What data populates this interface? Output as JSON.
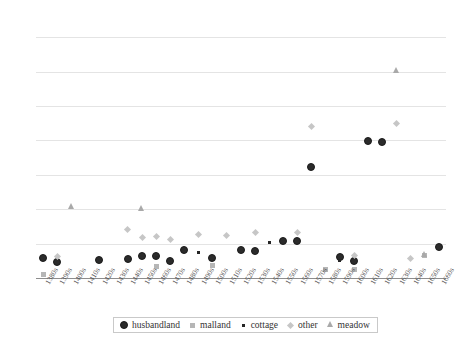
{
  "chart_data": {
    "type": "scatter",
    "title": "",
    "xlabel": "",
    "ylabel": "Rent (s.)",
    "ylim": [
      0,
      75
    ],
    "yticks": [
      0,
      10,
      20,
      30,
      40,
      50,
      60,
      70
    ],
    "grid": true,
    "legend_position": "bottom",
    "categories": [
      "1380s",
      "1390s",
      "1400s",
      "1410s",
      "1420s",
      "1430s",
      "1440s",
      "1450s",
      "1460s",
      "1470s",
      "1480s",
      "1490s",
      "1500s",
      "1510s",
      "1520s",
      "1530s",
      "1540s",
      "1550s",
      "1560s",
      "1570s",
      "1580s",
      "1590s",
      "1600s",
      "1610s",
      "1620s",
      "1630s",
      "1640s",
      "1650s",
      "1660s"
    ],
    "series": [
      {
        "name": "husbandland",
        "color": "#2b2b2b",
        "marker": "circle",
        "points": [
          {
            "x": "1380s",
            "y": 5.7
          },
          {
            "x": "1390s",
            "y": 4.6
          },
          {
            "x": "1420s",
            "y": 5.2
          },
          {
            "x": "1440s",
            "y": 5.3
          },
          {
            "x": "1450s",
            "y": 6.3
          },
          {
            "x": "1460s",
            "y": 6.3
          },
          {
            "x": "1470s",
            "y": 5.0
          },
          {
            "x": "1480s",
            "y": 8.0
          },
          {
            "x": "1500s",
            "y": 5.6
          },
          {
            "x": "1520s",
            "y": 8.1
          },
          {
            "x": "1530s",
            "y": 7.7
          },
          {
            "x": "1550s",
            "y": 10.7
          },
          {
            "x": "1560s",
            "y": 10.7
          },
          {
            "x": "1570s",
            "y": 32.3
          },
          {
            "x": "1590s",
            "y": 6.1
          },
          {
            "x": "1600s",
            "y": 5.0
          },
          {
            "x": "1610s",
            "y": 39.6
          },
          {
            "x": "1620s",
            "y": 39.5
          },
          {
            "x": "1660s",
            "y": 9.0
          }
        ]
      },
      {
        "name": "malland",
        "color": "#b6b6b6",
        "marker": "square",
        "points": [
          {
            "x": "1380s",
            "y": 1.1
          },
          {
            "x": "1460s",
            "y": 3.4
          },
          {
            "x": "1500s",
            "y": 3.6
          },
          {
            "x": "1580s",
            "y": 2.6
          },
          {
            "x": "1600s",
            "y": 2.4
          },
          {
            "x": "1650s",
            "y": 6.5
          }
        ]
      },
      {
        "name": "cottage",
        "color": "#262626",
        "marker": "dot",
        "points": [
          {
            "x": "1460s",
            "y": 6.0
          },
          {
            "x": "1490s",
            "y": 7.4
          },
          {
            "x": "1540s",
            "y": 10.3
          },
          {
            "x": "1590s",
            "y": 5.2
          }
        ]
      },
      {
        "name": "other",
        "color": "#c6c6c6",
        "marker": "diamond",
        "points": [
          {
            "x": "1390s",
            "y": 6.3
          },
          {
            "x": "1440s",
            "y": 14.0
          },
          {
            "x": "1450s",
            "y": 11.7
          },
          {
            "x": "1460s",
            "y": 12.2
          },
          {
            "x": "1470s",
            "y": 11.2
          },
          {
            "x": "1490s",
            "y": 12.7
          },
          {
            "x": "1510s",
            "y": 12.5
          },
          {
            "x": "1530s",
            "y": 13.3
          },
          {
            "x": "1560s",
            "y": 13.2
          },
          {
            "x": "1570s",
            "y": 44.0
          },
          {
            "x": "1600s",
            "y": 6.4
          },
          {
            "x": "1630s",
            "y": 44.9
          },
          {
            "x": "1640s",
            "y": 5.7
          }
        ]
      },
      {
        "name": "meadow",
        "color": "#a9a9a9",
        "marker": "triangle",
        "points": [
          {
            "x": "1400s",
            "y": 20.6
          },
          {
            "x": "1450s",
            "y": 20.2
          },
          {
            "x": "1630s",
            "y": 60.2
          },
          {
            "x": "1650s",
            "y": 6.6
          }
        ]
      }
    ]
  },
  "legend": {
    "items": [
      {
        "label": "husbandland"
      },
      {
        "label": "malland"
      },
      {
        "label": "cottage"
      },
      {
        "label": "other"
      },
      {
        "label": "meadow"
      }
    ]
  }
}
